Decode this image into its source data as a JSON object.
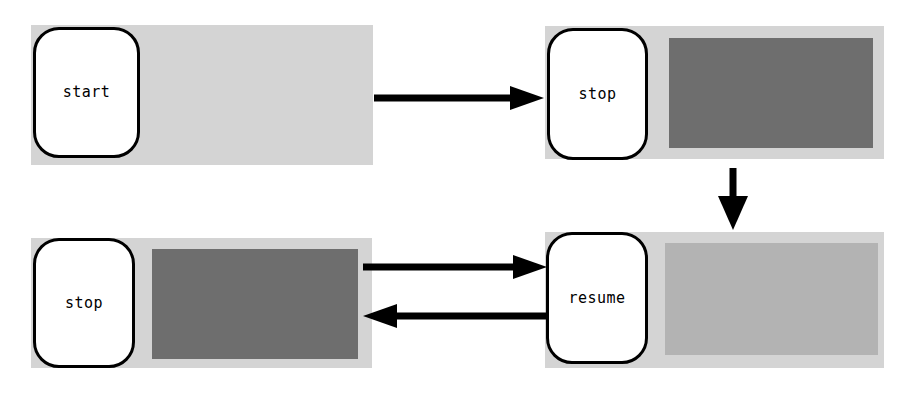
{
  "diagram": {
    "canvas": {
      "width": 912,
      "height": 400,
      "background": "#ffffff"
    },
    "colors": {
      "band": "#d4d4d4",
      "fill_dark": "#6e6e6e",
      "fill_medium": "#b3b3b3",
      "capsule_fill": "#ffffff",
      "stroke": "#000000"
    },
    "nodes": [
      {
        "id": "start",
        "label": "start",
        "position": "top-left",
        "band": {
          "x": 31,
          "y": 25,
          "w": 342,
          "h": 140
        },
        "capsule": {
          "x": 33,
          "y": 27,
          "w": 107,
          "h": 131
        },
        "fill": null
      },
      {
        "id": "stop-top",
        "label": "stop",
        "position": "top-right",
        "band": {
          "x": 545,
          "y": 26,
          "w": 339,
          "h": 133
        },
        "capsule": {
          "x": 547,
          "y": 28,
          "w": 101,
          "h": 132
        },
        "fill": {
          "x": 124,
          "y": 12,
          "w": 204,
          "h": 110,
          "color": "#6e6e6e"
        }
      },
      {
        "id": "stop-bottom",
        "label": "stop",
        "position": "bottom-left",
        "band": {
          "x": 31,
          "y": 238,
          "w": 341,
          "h": 130
        },
        "capsule": {
          "x": 33,
          "y": 238,
          "w": 102,
          "h": 130
        },
        "fill": {
          "x": 121,
          "y": 11,
          "w": 206,
          "h": 110,
          "color": "#6e6e6e"
        }
      },
      {
        "id": "resume",
        "label": "resume",
        "position": "bottom-right",
        "band": {
          "x": 545,
          "y": 232,
          "w": 339,
          "h": 136
        },
        "capsule": {
          "x": 546,
          "y": 232,
          "w": 102,
          "h": 132
        },
        "fill": {
          "x": 120,
          "y": 11,
          "w": 213,
          "h": 112,
          "color": "#b3b3b3"
        }
      }
    ],
    "arrows": [
      {
        "id": "start-to-stop",
        "from": "start",
        "to": "stop-top",
        "direction": "right",
        "x": 374,
        "y": 86,
        "w": 170,
        "h": 24
      },
      {
        "id": "stop-to-resume",
        "from": "stop-top",
        "to": "resume",
        "direction": "down",
        "x": 716,
        "y": 168,
        "w": 34,
        "h": 62
      },
      {
        "id": "stopbottom-to-resume",
        "from": "stop-bottom",
        "to": "resume",
        "direction": "right",
        "x": 363,
        "y": 255,
        "w": 184,
        "h": 24
      },
      {
        "id": "resume-to-stopbottom",
        "from": "resume",
        "to": "stop-bottom",
        "direction": "left",
        "x": 360,
        "y": 304,
        "w": 187,
        "h": 24
      }
    ]
  }
}
